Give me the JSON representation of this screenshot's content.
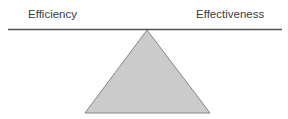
{
  "diagram": {
    "beam": {
      "left_label": "Efficiency",
      "right_label": "Effectiveness",
      "line_color": "#515151",
      "line_x1": "8",
      "line_x2": "282",
      "line_y": "29.5",
      "line_width": "1.7"
    },
    "fulcrum": {
      "shape": "triangle",
      "points": "147,30 85,113 210,113",
      "fill_color": "#cbcbcb",
      "stroke_color": "#858585",
      "stroke_width": "1"
    },
    "text_color": "#3c3c3c",
    "background_color": "#ffffff"
  }
}
